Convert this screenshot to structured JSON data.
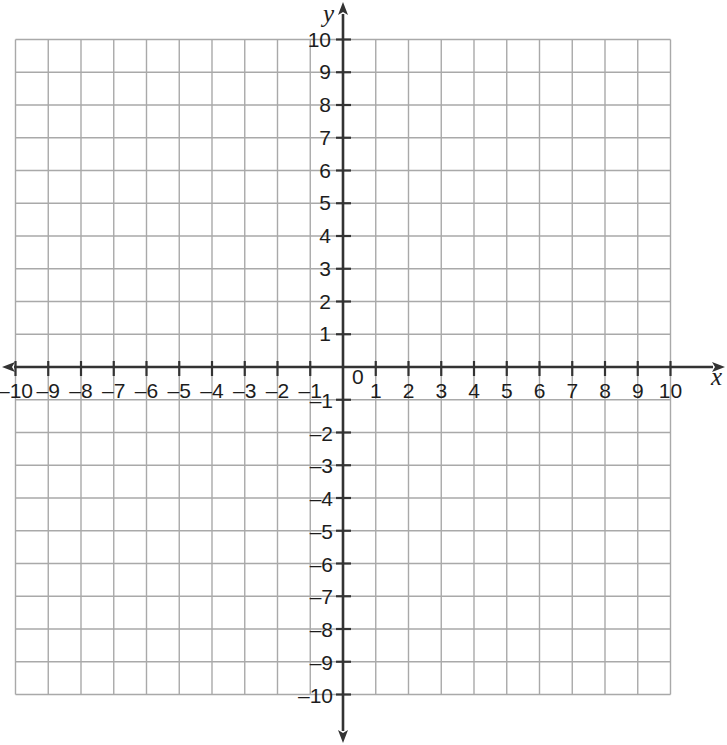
{
  "figure": {
    "title": "",
    "background_color": "#ffffff",
    "grid_color": "#a9a9a9",
    "axis_color": "#333333",
    "label_color": "#1d1d1d"
  },
  "axes": {
    "x_axis_label": "x",
    "y_axis_label": "y",
    "origin_label": "0",
    "x_min": -10,
    "x_max": 10,
    "y_min": -10,
    "y_max": 10,
    "step": 1
  },
  "x_tick_labels_negative": [
    "–10",
    "–9",
    "–8",
    "–7",
    "–6",
    "–5",
    "–4",
    "–3",
    "–2",
    "–1"
  ],
  "x_tick_labels_positive": [
    "1",
    "2",
    "3",
    "4",
    "5",
    "6",
    "7",
    "8",
    "9",
    "10"
  ],
  "y_tick_labels_positive": [
    "1",
    "2",
    "3",
    "4",
    "5",
    "6",
    "7",
    "8",
    "9",
    "10"
  ],
  "y_tick_labels_negative": [
    "–1",
    "–2",
    "–3",
    "–4",
    "–5",
    "–6",
    "–7",
    "–8",
    "–9",
    "–10"
  ],
  "chart_data": {
    "type": "scatter",
    "title": "",
    "subtitle": "",
    "xlabel": "x",
    "ylabel": "y",
    "xlim": [
      -10,
      10
    ],
    "ylim": [
      -10,
      10
    ],
    "xticks": [
      -10,
      -9,
      -8,
      -7,
      -6,
      -5,
      -4,
      -3,
      -2,
      -1,
      0,
      1,
      2,
      3,
      4,
      5,
      6,
      7,
      8,
      9,
      10
    ],
    "yticks": [
      -10,
      -9,
      -8,
      -7,
      -6,
      -5,
      -4,
      -3,
      -2,
      -1,
      0,
      1,
      2,
      3,
      4,
      5,
      6,
      7,
      8,
      9,
      10
    ],
    "xticklabels": [
      "–10",
      "–9",
      "–8",
      "–7",
      "–6",
      "–5",
      "–4",
      "–3",
      "–2",
      "–1",
      "0",
      "1",
      "2",
      "3",
      "4",
      "5",
      "6",
      "7",
      "8",
      "9",
      "10"
    ],
    "yticklabels": [
      "–10",
      "–9",
      "–8",
      "–7",
      "–6",
      "–5",
      "–4",
      "–3",
      "–2",
      "–1",
      "0",
      "1",
      "2",
      "3",
      "4",
      "5",
      "6",
      "7",
      "8",
      "9",
      "10"
    ],
    "grid": true,
    "grid_minor": false,
    "legend": null,
    "legend_position": "none",
    "annotations": [],
    "series": [],
    "x": [],
    "y": []
  }
}
